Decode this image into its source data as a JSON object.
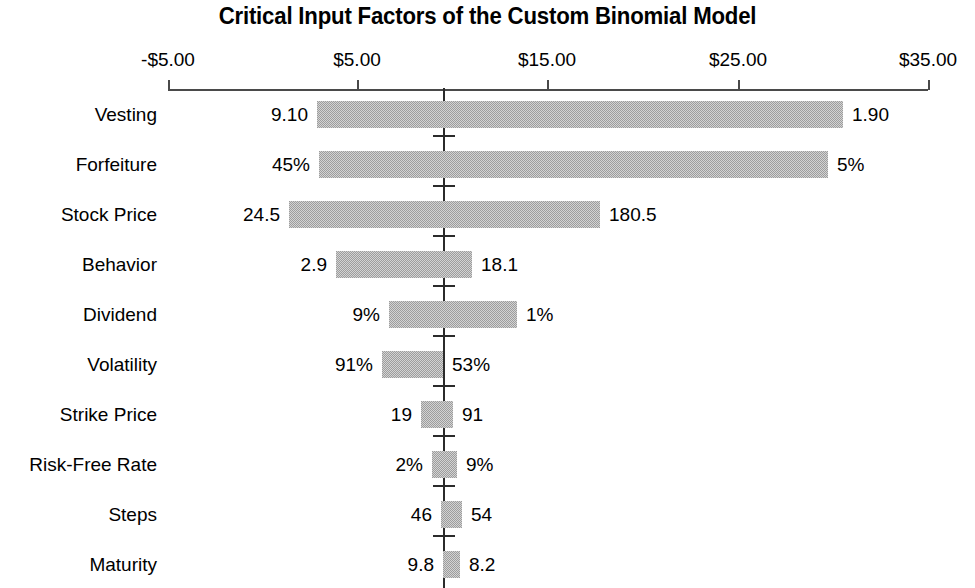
{
  "chart_data": {
    "type": "bar",
    "subtype": "tornado",
    "title": "Critical Input Factors of the Custom Binomial Model",
    "xlabel": "",
    "ylabel": "",
    "xlim": [
      -5,
      35
    ],
    "x_tick_labels": [
      "-$5.00",
      "$5.00",
      "$15.00",
      "$25.00",
      "$35.00"
    ],
    "x_ticks": [
      -5,
      5,
      15,
      25,
      35
    ],
    "x_tick_px": [
      168,
      357,
      547,
      738,
      928
    ],
    "grid": false,
    "legend": null,
    "baseline_value": 9.55,
    "baseline_px": 443,
    "axis_px_per_unit": 19.0,
    "categories": [
      "Vesting",
      "Forfeiture",
      "Stock Price",
      "Behavior",
      "Dividend",
      "Volatility",
      "Strike Price",
      "Risk-Free Rate",
      "Steps",
      "Maturity"
    ],
    "bars": [
      {
        "category": "Vesting",
        "low_label": "9.10",
        "high_label": "1.90",
        "low_x": 2.7,
        "high_x": 30.6,
        "low_px": 317,
        "high_px": 843
      },
      {
        "category": "Forfeiture",
        "low_label": "45%",
        "high_label": "5%",
        "low_x": 2.8,
        "high_x": 29.8,
        "low_px": 319,
        "high_px": 828
      },
      {
        "category": "Stock Price",
        "low_label": "24.5",
        "high_label": "180.5",
        "low_x": 1.4,
        "high_x": 17.8,
        "low_px": 289,
        "high_px": 600
      },
      {
        "category": "Behavior",
        "low_label": "2.9",
        "high_label": "18.1",
        "low_x": 3.8,
        "high_x": 10.9,
        "low_px": 336,
        "high_px": 472
      },
      {
        "category": "Dividend",
        "low_label": "9%",
        "high_label": "1%",
        "low_x": 6.6,
        "high_x": 13.3,
        "low_px": 389,
        "high_px": 517
      },
      {
        "category": "Volatility",
        "low_label": "91%",
        "high_label": "53%",
        "low_x": 6.3,
        "high_x": 9.5,
        "low_px": 382,
        "high_px": 443
      },
      {
        "category": "Strike Price",
        "low_label": "19",
        "high_label": "91",
        "low_x": 8.3,
        "high_x": 10.0,
        "low_px": 421,
        "high_px": 453
      },
      {
        "category": "Risk-Free Rate",
        "low_label": "2%",
        "high_label": "9%",
        "low_x": 8.9,
        "high_x": 10.2,
        "low_px": 432,
        "high_px": 457
      },
      {
        "category": "Steps",
        "low_label": "46",
        "high_label": "54",
        "low_x": 9.4,
        "high_x": 10.5,
        "low_px": 441,
        "high_px": 462
      },
      {
        "category": "Maturity",
        "low_label": "9.8",
        "high_label": "8.2",
        "low_x": 9.5,
        "high_x": 10.4,
        "low_px": 443,
        "high_px": 460
      }
    ],
    "colors": {
      "bar_fill": "#9d9d9d",
      "axis": "#4a4a4a",
      "baseline": "#2b2b2b",
      "text": "#000000",
      "background": "#ffffff"
    }
  }
}
